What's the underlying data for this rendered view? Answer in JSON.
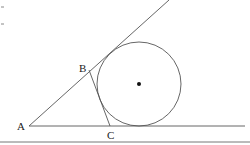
{
  "diagram": {
    "type": "geometry",
    "points": {
      "A": {
        "label": "A"
      },
      "B": {
        "label": "B"
      },
      "C": {
        "label": "C"
      }
    },
    "elements": [
      {
        "kind": "ray",
        "from": "A",
        "direction": "upper-right"
      },
      {
        "kind": "ray",
        "from": "A",
        "direction": "right"
      },
      {
        "kind": "segment",
        "from": "B",
        "to": "C"
      },
      {
        "kind": "circle",
        "tangent_to": [
          "ray A-upper",
          "ray A-right",
          "segment BC"
        ],
        "center_marked": true
      }
    ],
    "colors": {
      "stroke": "#555555",
      "text": "#222222",
      "background": "#ffffff"
    }
  }
}
